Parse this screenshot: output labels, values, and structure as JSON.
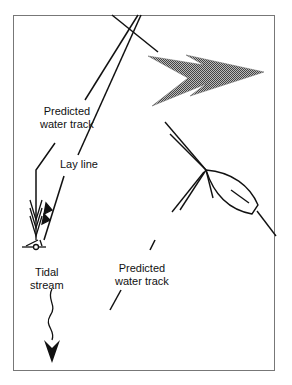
{
  "diagram": {
    "title": "",
    "labels": {
      "predicted_water_track_1": [
        "Predicted",
        "water track"
      ],
      "lay_line": "Lay line",
      "tidal_stream": [
        "Tidal",
        "stream"
      ],
      "predicted_water_track_2": [
        "Predicted",
        "water track"
      ]
    },
    "elements": {
      "wind_arrow": "wind-direction-arrow",
      "boat": "sailboat",
      "tidal_arrow": "tidal-stream-arrow",
      "mark": "buoy-mark"
    },
    "colors": {
      "line": "#111111",
      "frame": "#777777",
      "wind_fill": "#8a8a8a"
    }
  }
}
